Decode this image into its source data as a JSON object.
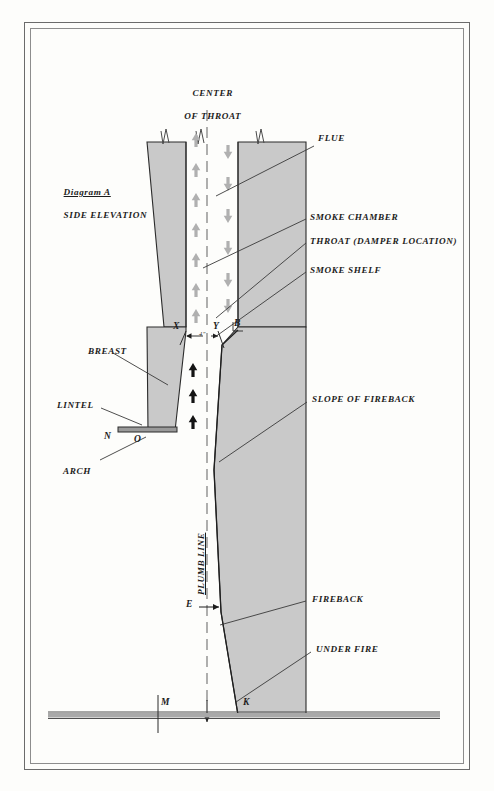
{
  "document": {
    "title": "Diagram A - Fireplace Side Elevation",
    "figure_label": "Diagram A",
    "figure_subtitle": "SIDE ELEVATION"
  },
  "colors": {
    "masonry_fill": "#c9c9c9",
    "masonry_stroke": "#2b2b2b",
    "flow_arrow_gray": "#b0b0b0",
    "flow_arrow_black": "#141414",
    "leader_line": "#3a3a3a",
    "frame_outer": "#6b6b6b",
    "frame_inner": "#8d8d8d",
    "hearth_gray": "#a9a9a9",
    "background": "#fdfdfb",
    "text": "#1c1c1c"
  },
  "labels": {
    "center_of_throat_line1": "CENTER",
    "center_of_throat_line2": "OF THROAT",
    "flue": "FLUE",
    "smoke_chamber": "SMOKE CHAMBER",
    "throat_damper": "THROAT (DAMPER LOCATION)",
    "smoke_shelf": "SMOKE SHELF",
    "breast": "BREAST",
    "lintel": "LINTEL",
    "arch": "ARCH",
    "slope_of_fireback": "SLOPE OF FIREBACK",
    "fireback": "FIREBACK",
    "under_fire": "UNDER FIRE",
    "plumb_line": "PLUMB LINE",
    "throat_dimension": "4\""
  },
  "points": {
    "x": "X",
    "y": "Y",
    "b": "B",
    "n": "N",
    "o": "O",
    "e": "E",
    "m": "M",
    "k": "K"
  },
  "flow": {
    "up_arrow_count_flue": 7,
    "down_arrow_count_flue": 6,
    "up_arrow_count_throat": 3,
    "up_meaning": "smoke rising",
    "down_meaning": "cold air descending"
  }
}
